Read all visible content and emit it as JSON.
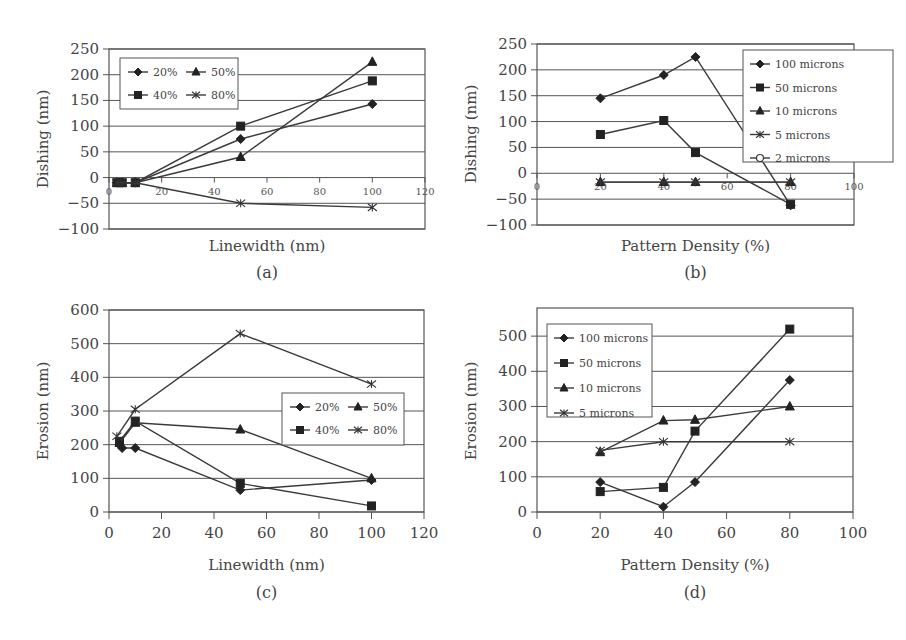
{
  "chart_data": [
    {
      "id": "a",
      "caption": "(a)",
      "type": "line",
      "title": "",
      "xlabel": "Linewidth (nm)",
      "ylabel": "Dishing (nm)",
      "xlim": [
        0,
        120
      ],
      "ylim": [
        -100,
        250
      ],
      "xticks": [
        0,
        20,
        40,
        60,
        80,
        100,
        120
      ],
      "yticks": [
        -100,
        -50,
        0,
        50,
        100,
        150,
        200,
        250
      ],
      "grid": "horizontal",
      "xtick_position": "on_zero_line",
      "legend": {
        "position": "upper-left",
        "columns": 2,
        "order": [
          "20%",
          "50%",
          "40%",
          "80%"
        ]
      },
      "series": [
        {
          "name": "20%",
          "marker": "diamond",
          "x": [
            3,
            5,
            10,
            50,
            100
          ],
          "y": [
            -10,
            -10,
            -10,
            75,
            143
          ]
        },
        {
          "name": "40%",
          "marker": "square",
          "x": [
            3,
            5,
            10,
            50,
            100
          ],
          "y": [
            -10,
            -10,
            -10,
            100,
            188
          ]
        },
        {
          "name": "50%",
          "marker": "triangle",
          "x": [
            3,
            5,
            10,
            50,
            100
          ],
          "y": [
            -10,
            -10,
            -10,
            40,
            225
          ]
        },
        {
          "name": "80%",
          "marker": "x",
          "x": [
            3,
            5,
            10,
            50,
            100
          ],
          "y": [
            -10,
            -10,
            -10,
            -50,
            -58
          ]
        }
      ]
    },
    {
      "id": "b",
      "caption": "(b)",
      "type": "line",
      "title": "",
      "xlabel": "Pattern Density (%)",
      "ylabel": "Dishing (nm)",
      "xlim": [
        0,
        100
      ],
      "ylim": [
        -100,
        250
      ],
      "xticks": [
        0,
        20,
        40,
        60,
        80,
        100
      ],
      "yticks": [
        -100,
        -50,
        0,
        50,
        100,
        150,
        200,
        250
      ],
      "grid": "horizontal",
      "xtick_position": "on_zero_line",
      "legend": {
        "position": "upper-right",
        "columns": 1,
        "order": [
          "100 microns",
          "50 microns",
          "10 microns",
          "5 microns",
          "2 microns"
        ]
      },
      "series": [
        {
          "name": "100 microns",
          "marker": "diamond",
          "x": [
            20,
            40,
            50,
            80
          ],
          "y": [
            145,
            190,
            225,
            -62
          ]
        },
        {
          "name": "50 microns",
          "marker": "square",
          "x": [
            20,
            40,
            50,
            80
          ],
          "y": [
            75,
            102,
            40,
            -60
          ]
        },
        {
          "name": "10 microns",
          "marker": "triangle",
          "x": [
            20,
            40,
            50,
            80
          ],
          "y": [
            -17,
            -17,
            -17,
            -17
          ]
        },
        {
          "name": "5 microns",
          "marker": "x",
          "x": [
            20,
            40,
            50,
            80
          ],
          "y": [
            -17,
            -17,
            -17,
            -17
          ]
        },
        {
          "name": "2 microns",
          "marker": "circle",
          "x": [],
          "y": []
        }
      ]
    },
    {
      "id": "c",
      "caption": "(c)",
      "type": "line",
      "title": "",
      "xlabel": "Linewidth (nm)",
      "ylabel": "Erosion (nm)",
      "xlim": [
        0,
        120
      ],
      "ylim": [
        0,
        600
      ],
      "xticks": [
        0,
        20,
        40,
        60,
        80,
        100,
        120
      ],
      "yticks": [
        0,
        100,
        200,
        300,
        400,
        500,
        600
      ],
      "grid": "horizontal",
      "legend": {
        "position": "center-right",
        "columns": 2,
        "order": [
          "20%",
          "50%",
          "40%",
          "80%"
        ]
      },
      "series": [
        {
          "name": "20%",
          "marker": "diamond",
          "x": [
            4,
            5,
            10,
            50,
            100
          ],
          "y": [
            200,
            190,
            190,
            65,
            95
          ]
        },
        {
          "name": "40%",
          "marker": "square",
          "x": [
            4,
            10,
            50,
            100
          ],
          "y": [
            210,
            270,
            85,
            18
          ]
        },
        {
          "name": "50%",
          "marker": "triangle",
          "x": [
            4,
            10,
            50,
            100
          ],
          "y": [
            205,
            265,
            245,
            100
          ]
        },
        {
          "name": "80%",
          "marker": "x",
          "x": [
            3,
            10,
            50,
            100
          ],
          "y": [
            225,
            305,
            530,
            380
          ]
        }
      ]
    },
    {
      "id": "d",
      "caption": "(d)",
      "type": "line",
      "title": "",
      "xlabel": "Pattern Density (%)",
      "ylabel": "Erosion (nm)",
      "xlim": [
        0,
        100
      ],
      "ylim": [
        0,
        580
      ],
      "xticks": [
        0,
        20,
        40,
        60,
        80,
        100
      ],
      "yticks": [
        0,
        100,
        200,
        300,
        400,
        500
      ],
      "grid": "horizontal",
      "legend": {
        "position": "upper-left",
        "columns": 1,
        "order": [
          "100 microns",
          "50 microns",
          "10 microns",
          "5 microns"
        ]
      },
      "series": [
        {
          "name": "100 microns",
          "marker": "diamond",
          "x": [
            20,
            40,
            50,
            80
          ],
          "y": [
            85,
            15,
            85,
            375
          ]
        },
        {
          "name": "50 microns",
          "marker": "square",
          "x": [
            20,
            40,
            50,
            80
          ],
          "y": [
            58,
            70,
            230,
            520
          ]
        },
        {
          "name": "10 microns",
          "marker": "triangle",
          "x": [
            20,
            40,
            50,
            80
          ],
          "y": [
            170,
            260,
            262,
            300
          ]
        },
        {
          "name": "5 microns",
          "marker": "x",
          "x": [
            20,
            40,
            80
          ],
          "y": [
            175,
            200,
            200
          ]
        }
      ]
    }
  ],
  "layout": {
    "line_color": "#3a3a3a",
    "grid_color": "#555555",
    "text_color": "#444444",
    "background": "#ffffff"
  }
}
